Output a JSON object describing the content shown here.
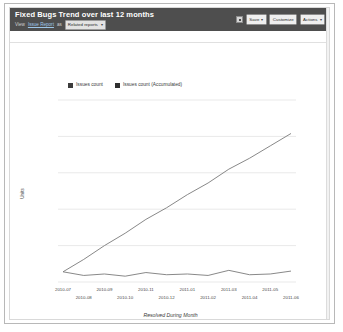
{
  "header": {
    "title": "Fixed Bugs Trend over last 12 months",
    "view_label": "View",
    "view_link": "Issue Report",
    "view_connector": "as",
    "related_select": "Related reports",
    "caret": "▾",
    "grid_icon": "grid-icon",
    "buttons": [
      {
        "label": "Save",
        "caret": "▾"
      },
      {
        "label": "Customize",
        "caret": ""
      },
      {
        "label": "Actions",
        "caret": "▾"
      }
    ]
  },
  "subtitle": "All Bugzendor data from current view",
  "colors": {
    "header_bg": "#4e4e4e",
    "series_issues": "#3c3c3c",
    "series_accumulated": "#2f2f2f",
    "gridline": "#e9e9e9",
    "line_stroke": "#7a7a7a"
  },
  "chart_data": {
    "type": "line",
    "title": "Fixed Bugs Trend over last 12 months",
    "xlabel": "Resolved During Month",
    "ylabel": "Units",
    "grid": true,
    "legend_position": "top",
    "categories": [
      "2010-07",
      "2010-08",
      "2010-09",
      "2010-10",
      "2010-11",
      "2010-12",
      "2011-01",
      "2011-02",
      "2011-03",
      "2011-04",
      "2011-05",
      "2011-06"
    ],
    "tick_labels_top": [
      "2010-07",
      "2010-09",
      "2010-11",
      "2011-01",
      "2011-03",
      "2011-05"
    ],
    "tick_labels_bottom": [
      "2010-08",
      "2010-10",
      "2010-12",
      "2011-02",
      "2011-04",
      "2011-06"
    ],
    "ylim": [
      0,
      500
    ],
    "yticks": [
      0,
      100,
      200,
      300,
      400,
      500
    ],
    "series": [
      {
        "name": "Issues count",
        "color": "#3c3c3c",
        "values": [
          28,
          18,
          22,
          16,
          26,
          20,
          22,
          18,
          32,
          20,
          22,
          30
        ]
      },
      {
        "name": "Issues count (Accumulated)",
        "color": "#2f2f2f",
        "values": [
          28,
          62,
          100,
          134,
          172,
          204,
          240,
          272,
          310,
          340,
          374,
          408
        ]
      }
    ]
  }
}
